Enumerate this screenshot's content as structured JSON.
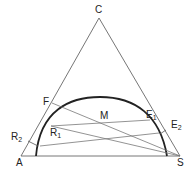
{
  "diagram": {
    "vertices": {
      "top": "C",
      "bottom_left": "A",
      "bottom_right": "S"
    },
    "points": {
      "F": "F",
      "M": "M",
      "R1": {
        "main": "R",
        "sub": "1"
      },
      "R2": {
        "main": "R",
        "sub": "2"
      },
      "E1": {
        "main": "E",
        "sub": "1"
      },
      "E2": {
        "main": "E",
        "sub": "2"
      }
    },
    "colors": {
      "line": "#555555",
      "curve": "#222222",
      "text": "#222222"
    }
  }
}
